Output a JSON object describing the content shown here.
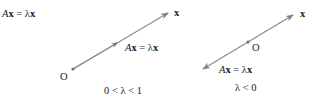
{
  "figure": {
    "title": {
      "lhs_matrix": "A",
      "lhs_vector": "x",
      "equals": " = ",
      "rhs_scalar": "λ",
      "rhs_vector": "x"
    },
    "colors": {
      "vector_line": "#808080",
      "text": "#1a1a1a",
      "origin_dot": "#707070"
    },
    "left_panel": {
      "vector_label": "x",
      "origin_label": "O",
      "image_label": {
        "matrix": "A",
        "vector": "x",
        "equals": " = ",
        "scalar": "λ",
        "vector2": "x"
      },
      "condition": "0 < λ < 1"
    },
    "right_panel": {
      "vector_label": "x",
      "origin_label": "O",
      "image_label": {
        "matrix": "A",
        "vector": "x",
        "equals": " = ",
        "scalar": "λ",
        "vector2": "x"
      },
      "condition": "λ < 0"
    }
  }
}
